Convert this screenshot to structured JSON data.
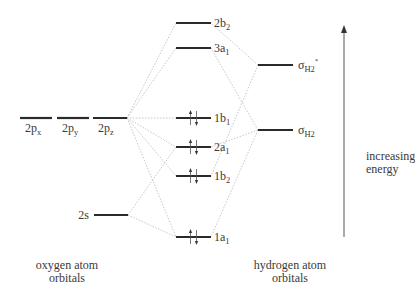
{
  "diagram": {
    "type": "molecular-orbital-diagram",
    "colors": {
      "level": "#2a2a2a",
      "connector": "#b8b8b8",
      "text": "#3a3a3a",
      "arrow": "#555555"
    },
    "oxygen": {
      "caption_line1": "oxygen atom",
      "caption_line2": "orbitals",
      "orbitals": [
        {
          "id": "2px",
          "base": "2p",
          "sub": "x",
          "x1": 20,
          "x2": 52,
          "y": 118
        },
        {
          "id": "2py",
          "base": "2p",
          "sub": "y",
          "x1": 57,
          "x2": 89,
          "y": 118
        },
        {
          "id": "2pz",
          "base": "2p",
          "sub": "z",
          "x1": 93,
          "x2": 127,
          "y": 118
        },
        {
          "id": "2s",
          "base": "2s",
          "sub": "",
          "x1": 94,
          "x2": 128,
          "y": 215
        }
      ]
    },
    "molecular": {
      "orbitals": [
        {
          "id": "2b2",
          "base": "2b",
          "sub": "2",
          "y": 23,
          "electrons": 0
        },
        {
          "id": "3a1",
          "base": "3a",
          "sub": "1",
          "y": 48,
          "electrons": 0
        },
        {
          "id": "1b1",
          "base": "1b",
          "sub": "1",
          "y": 118,
          "electrons": 2
        },
        {
          "id": "2a1",
          "base": "2a",
          "sub": "1",
          "y": 147,
          "electrons": 2
        },
        {
          "id": "1b2",
          "base": "1b",
          "sub": "2",
          "y": 176,
          "electrons": 2
        },
        {
          "id": "1a1",
          "base": "1a",
          "sub": "1",
          "y": 237,
          "electrons": 2
        }
      ],
      "x1": 176,
      "x2": 211
    },
    "hydrogen": {
      "caption_line1": "hydrogen atom",
      "caption_line2": "orbitals",
      "orbitals": [
        {
          "id": "sigma_star",
          "base": "σ",
          "sub": "H2",
          "sup": "*",
          "y": 65
        },
        {
          "id": "sigma",
          "base": "σ",
          "sub": "H2",
          "sup": "",
          "y": 130
        }
      ],
      "x1": 258,
      "x2": 293
    },
    "energy_axis": {
      "label_line1": "increasing",
      "label_line2": "energy",
      "x": 344,
      "y_top": 25,
      "y_bottom": 237
    }
  }
}
